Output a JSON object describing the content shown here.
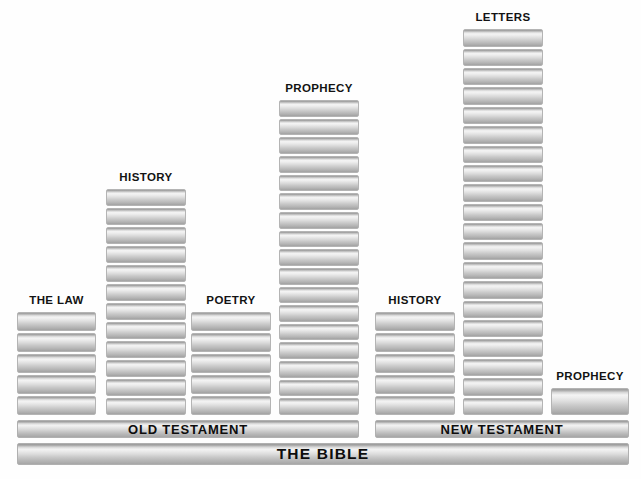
{
  "diagram": {
    "title": "The Bible",
    "background_color": "#fefefe",
    "block_color": "#d8d8d8",
    "text_color": "#131313"
  },
  "chart_data": {
    "type": "bar",
    "title": "THE BIBLE",
    "xlabel": "",
    "ylabel": "Number of books",
    "categories": [
      "THE LAW",
      "HISTORY",
      "POETRY",
      "PROPHECY",
      "HISTORY",
      "LETTERS",
      "PROPHECY"
    ],
    "values": [
      5,
      12,
      5,
      17,
      5,
      20,
      1
    ],
    "groups": [
      {
        "name": "OLD TESTAMENT",
        "categories": [
          "THE LAW",
          "HISTORY",
          "POETRY",
          "PROPHECY"
        ],
        "values": [
          5,
          12,
          5,
          17
        ]
      },
      {
        "name": "NEW TESTAMENT",
        "categories": [
          "HISTORY",
          "LETTERS",
          "PROPHECY"
        ],
        "values": [
          5,
          20,
          1
        ]
      }
    ],
    "ylim": [
      0,
      20
    ],
    "grid": false,
    "legend": "none"
  },
  "columns": [
    {
      "id": "ot-law",
      "label": "THE LAW",
      "blocks": 5,
      "left": 17,
      "width": 79,
      "label_top": 294
    },
    {
      "id": "ot-history",
      "label": "HISTORY",
      "blocks": 12,
      "left": 106,
      "width": 80,
      "label_top": 171
    },
    {
      "id": "ot-poetry",
      "label": "POETRY",
      "blocks": 5,
      "left": 191,
      "width": 80,
      "label_top": 294
    },
    {
      "id": "ot-prophecy",
      "label": "PROPHECY",
      "blocks": 17,
      "left": 279,
      "width": 80,
      "label_top": 82
    },
    {
      "id": "nt-history",
      "label": "HISTORY",
      "blocks": 5,
      "left": 375,
      "width": 80,
      "label_top": 294
    },
    {
      "id": "nt-letters",
      "label": "LETTERS",
      "blocks": 20,
      "left": 463,
      "width": 80,
      "label_top": 11
    },
    {
      "id": "nt-prophecy",
      "label": "PROPHECY",
      "blocks": 1,
      "left": 551,
      "width": 78,
      "label_top": 370
    }
  ],
  "bars": [
    {
      "id": "old-testament",
      "label": "OLD TESTAMENT",
      "left": 17,
      "top": 420,
      "width": 342,
      "height": 18
    },
    {
      "id": "new-testament",
      "label": "NEW TESTAMENT",
      "left": 375,
      "top": 420,
      "width": 254,
      "height": 18
    },
    {
      "id": "the-bible",
      "label": "THE BIBLE",
      "left": 17,
      "top": 443,
      "width": 612,
      "height": 22
    }
  ]
}
